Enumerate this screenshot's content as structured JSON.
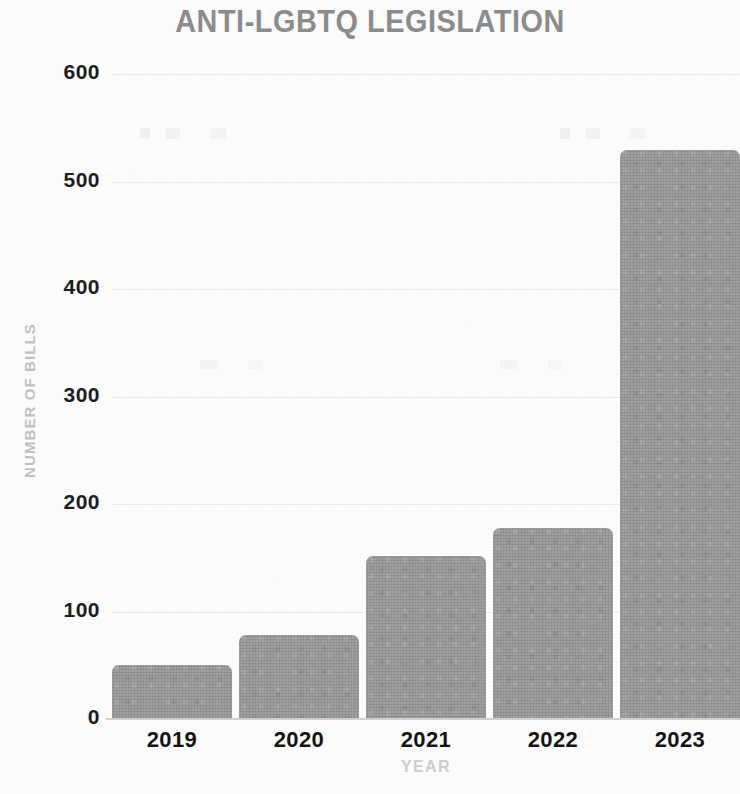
{
  "chart_data": {
    "type": "bar",
    "title": "ANTI-LGBTQ LEGISLATION",
    "xlabel": "YEAR",
    "ylabel": "NUMBER OF BILLS",
    "categories": [
      "2019",
      "2020",
      "2021",
      "2022",
      "2023"
    ],
    "values": [
      50,
      78,
      152,
      178,
      529
    ],
    "ylim": [
      0,
      600
    ],
    "yticks": [
      0,
      100,
      200,
      300,
      400,
      500,
      600
    ],
    "ytick_labels": [
      "0",
      "100",
      "200",
      "300",
      "400",
      "500",
      "600"
    ],
    "grid": true,
    "legend": null,
    "series": [
      {
        "name": "Number of bills",
        "values": [
          50,
          78,
          152,
          178,
          529
        ]
      }
    ],
    "bar_color": "#979797",
    "title_color": "#8d8d8d",
    "axis_title_color": "#cacaca",
    "tick_label_color": "#1d1d1d",
    "background_color": "#fdfdfd",
    "note": "Rightmost bar (2023) is cropped by the image edge"
  }
}
